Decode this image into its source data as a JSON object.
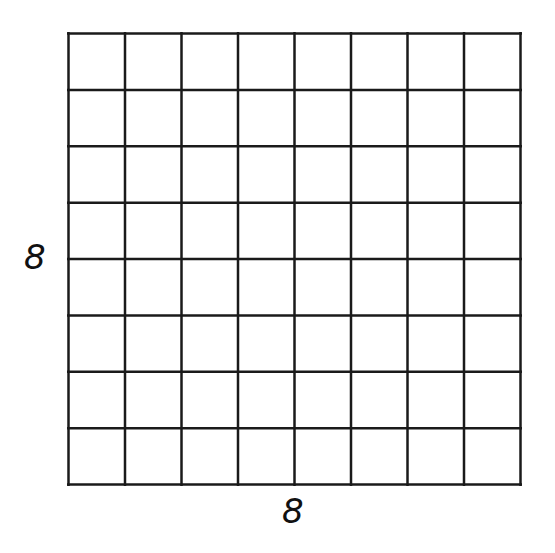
{
  "diagram": {
    "type": "square-grid",
    "rows": 8,
    "columns": 8,
    "line_color": "#1a1a1a",
    "background": "#ffffff",
    "labels": {
      "side": "8",
      "bottom": "8"
    }
  }
}
